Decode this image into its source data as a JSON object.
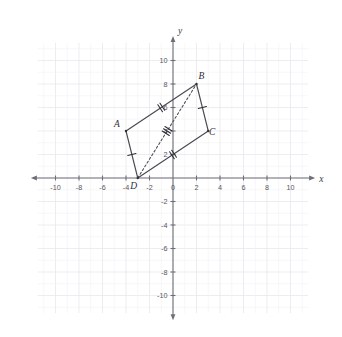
{
  "figure": {
    "type": "coordinate-geometry-diagram",
    "axes": {
      "x_axis_name": "x",
      "y_axis_name": "y",
      "x_tick_labels": [
        "-10",
        "-8",
        "-6",
        "-4",
        "-2",
        "0",
        "2",
        "4",
        "6",
        "8",
        "10"
      ],
      "x_tick_values": [
        -10,
        -8,
        -6,
        -4,
        -2,
        0,
        2,
        4,
        6,
        8,
        10
      ],
      "y_tick_labels": [
        "10",
        "8",
        "6",
        "4",
        "2",
        "-2",
        "-4",
        "-6",
        "-8",
        "-10"
      ],
      "y_tick_values": [
        10,
        8,
        6,
        4,
        2,
        -2,
        -4,
        -6,
        -8,
        -10
      ],
      "x_range": [
        -11.5,
        11.5
      ],
      "y_range": [
        -11.5,
        11.5
      ],
      "grid": "on",
      "grid_step": 2,
      "grid_substep": 1
    },
    "vertices": [
      {
        "label": "A",
        "x": -4,
        "y": 4,
        "label_dx": -9,
        "label_dy": -4
      },
      {
        "label": "B",
        "x": 2,
        "y": 8,
        "label_dx": 5,
        "label_dy": -5
      },
      {
        "label": "C",
        "x": 3,
        "y": 4,
        "label_dx": 4,
        "label_dy": 4
      },
      {
        "label": "D",
        "x": -3,
        "y": 0,
        "label_dx": -4,
        "label_dy": 11
      }
    ],
    "edges": [
      {
        "name": "AB",
        "from": "A",
        "to": "B",
        "style": "solid",
        "hatch_count": 2
      },
      {
        "name": "BC",
        "from": "B",
        "to": "C",
        "style": "solid",
        "hatch_count": 1
      },
      {
        "name": "DC",
        "from": "D",
        "to": "C",
        "style": "solid",
        "hatch_count": 2
      },
      {
        "name": "AD",
        "from": "A",
        "to": "D",
        "style": "solid",
        "hatch_count": 1
      }
    ],
    "diagonal": {
      "name": "DB",
      "from": "D",
      "to": "B",
      "style": "dashed",
      "hatch_count": 3
    },
    "colors": {
      "grid": "#e8e8ec",
      "axis": "#6e6e78",
      "shape_stroke": "#4a4a52",
      "label_text": "#2e2e36",
      "background": "#ffffff"
    }
  }
}
